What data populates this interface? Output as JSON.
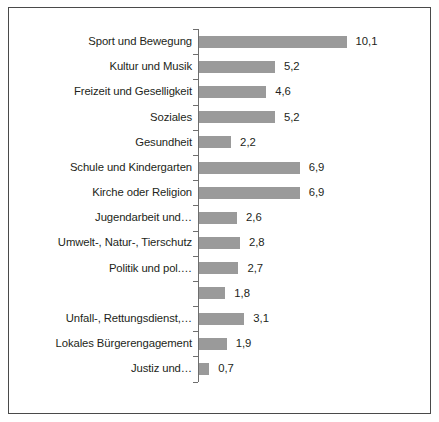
{
  "chart_data": {
    "type": "bar",
    "orientation": "horizontal",
    "title": "",
    "subtitle": "",
    "xlabel": "",
    "ylabel": "",
    "grid": false,
    "legend": false,
    "axis_ticks_visible": true,
    "value_label_decimal_separator": ",",
    "xlim": [
      0,
      10.1
    ],
    "bar_color": "#9a9a9a",
    "text_color": "#231f20",
    "axis_color": "#6e6e6e",
    "frame_color": "#4a4a4a",
    "background": "#ffffff",
    "categories": [
      "Sport und Bewegung",
      "Kultur und Musik",
      "Freizeit und Geselligkeit",
      "Soziales",
      "Gesundheit",
      "Schule und Kindergarten",
      "Kirche oder Religion",
      "Jugendarbeit und…",
      "Umwelt-, Natur-, Tierschutz",
      "Politik und pol.…",
      "",
      "Unfall-, Rettungsdienst,…",
      "Lokales Bürgerengagement",
      "Justiz und…"
    ],
    "values": [
      10.1,
      5.2,
      4.6,
      5.2,
      2.2,
      6.9,
      6.9,
      2.6,
      2.8,
      2.7,
      1.8,
      3.1,
      1.9,
      0.7
    ],
    "value_labels": [
      "10,1",
      "5,2",
      "4,6",
      "5,2",
      "2,2",
      "6,9",
      "6,9",
      "2,6",
      "2,8",
      "2,7",
      "1,8",
      "3,1",
      "1,9",
      "0,7"
    ]
  }
}
